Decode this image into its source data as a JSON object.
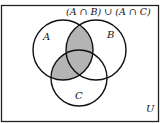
{
  "diagram": {
    "type": "venn",
    "title": "(A ∩ B) ∪ (A ∩ C)",
    "universe_label": "U",
    "sets": [
      {
        "label": "A",
        "cx": 63,
        "cy": 50,
        "r": 30
      },
      {
        "label": "B",
        "cx": 96,
        "cy": 50,
        "r": 30
      },
      {
        "label": "C",
        "cx": 79,
        "cy": 78,
        "r": 28
      }
    ],
    "shaded_region": "(A ∩ B) ∪ (A ∩ C)",
    "colors": {
      "shade": "#b4b4b4",
      "stroke": "#111111",
      "background": "#ffffff"
    }
  }
}
